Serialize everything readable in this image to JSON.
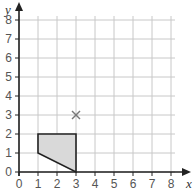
{
  "diagram": {
    "type": "coordinate-grid",
    "x_axis": {
      "label": "x",
      "min": 0,
      "max": 8,
      "ticks": [
        "0",
        "1",
        "2",
        "3",
        "4",
        "5",
        "6",
        "7",
        "8"
      ]
    },
    "y_axis": {
      "label": "y",
      "min": 0,
      "max": 8,
      "ticks": [
        "0",
        "1",
        "2",
        "3",
        "4",
        "5",
        "6",
        "7",
        "8"
      ]
    },
    "shape": {
      "vertices": [
        [
          1,
          1
        ],
        [
          1,
          2
        ],
        [
          3,
          2
        ],
        [
          3,
          0
        ]
      ],
      "fill": "#d9d9d9",
      "stroke": "#222222"
    },
    "marker": {
      "symbol": "cross",
      "point": [
        3,
        3
      ],
      "color": "#777777"
    },
    "colors": {
      "grid": "#c8c8c8",
      "axis": "#222222",
      "background": "#ffffff"
    }
  }
}
